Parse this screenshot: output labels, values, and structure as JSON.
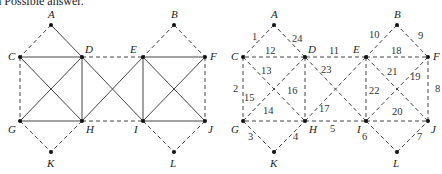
{
  "caption": "a Possible answer.",
  "graph_left": {
    "title": "Original graph",
    "nodes": {
      "A": [
        51,
        25
      ],
      "B": [
        174,
        25
      ],
      "C": [
        20,
        57
      ],
      "D": [
        82,
        57
      ],
      "E": [
        143,
        57
      ],
      "F": [
        205,
        57
      ],
      "G": [
        20,
        121
      ],
      "H": [
        82,
        121
      ],
      "I": [
        143,
        121
      ],
      "J": [
        205,
        121
      ],
      "K": [
        51,
        152
      ],
      "L": [
        174,
        152
      ]
    },
    "solid_edges": [
      [
        "A",
        "D"
      ],
      [
        "C",
        "D"
      ],
      [
        "C",
        "H"
      ],
      [
        "D",
        "G"
      ],
      [
        "D",
        "H"
      ],
      [
        "G",
        "H"
      ],
      [
        "D",
        "I"
      ],
      [
        "E",
        "H"
      ],
      [
        "E",
        "F"
      ],
      [
        "E",
        "I"
      ],
      [
        "E",
        "J"
      ],
      [
        "F",
        "I"
      ],
      [
        "I",
        "J"
      ]
    ],
    "dashed_edges": [
      [
        "A",
        "C"
      ],
      [
        "C",
        "G"
      ],
      [
        "D",
        "E"
      ],
      [
        "G",
        "K"
      ],
      [
        "H",
        "K"
      ],
      [
        "H",
        "I"
      ],
      [
        "B",
        "E"
      ],
      [
        "B",
        "F"
      ],
      [
        "F",
        "J"
      ],
      [
        "I",
        "L"
      ],
      [
        "J",
        "L"
      ]
    ]
  },
  "graph_right": {
    "title": "Euler circuit numbering",
    "edges": [
      {
        "from": "A",
        "to": "C",
        "n": "1"
      },
      {
        "from": "C",
        "to": "G",
        "n": "2"
      },
      {
        "from": "G",
        "to": "K",
        "n": "3"
      },
      {
        "from": "K",
        "to": "H",
        "n": "4"
      },
      {
        "from": "H",
        "to": "I",
        "n": "5"
      },
      {
        "from": "I",
        "to": "L",
        "n": "6"
      },
      {
        "from": "L",
        "to": "J",
        "n": "7"
      },
      {
        "from": "J",
        "to": "F",
        "n": "8"
      },
      {
        "from": "F",
        "to": "B",
        "n": "9"
      },
      {
        "from": "B",
        "to": "E",
        "n": "10"
      },
      {
        "from": "E",
        "to": "D",
        "n": "11"
      },
      {
        "from": "D",
        "to": "C",
        "n": "12"
      },
      {
        "from": "C",
        "to": "H",
        "n": "13"
      },
      {
        "from": "H",
        "to": "G",
        "n": "14"
      },
      {
        "from": "G",
        "to": "D",
        "n": "15"
      },
      {
        "from": "D",
        "to": "H",
        "n": "16"
      },
      {
        "from": "H",
        "to": "E",
        "n": "17"
      },
      {
        "from": "E",
        "to": "F",
        "n": "18"
      },
      {
        "from": "F",
        "to": "I",
        "n": "19"
      },
      {
        "from": "I",
        "to": "J",
        "n": "20"
      },
      {
        "from": "J",
        "to": "E",
        "n": "21"
      },
      {
        "from": "E",
        "to": "I",
        "n": "22"
      },
      {
        "from": "I",
        "to": "D",
        "n": "23"
      },
      {
        "from": "D",
        "to": "A",
        "n": "24"
      }
    ]
  }
}
